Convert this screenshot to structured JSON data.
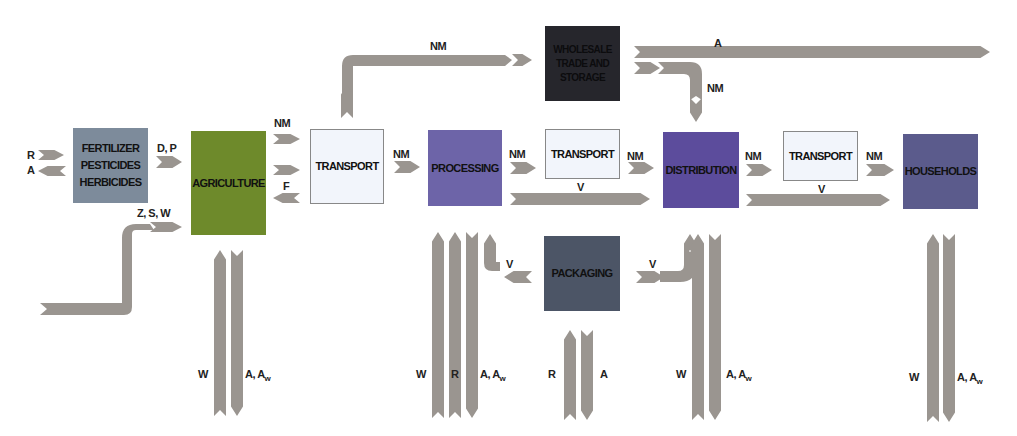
{
  "diagram": {
    "nodes": {
      "fertilizer": {
        "label": "FERTILIZER\nPESTICIDES\nHERBICIDES",
        "color": "#7d8b9b"
      },
      "agriculture": {
        "label": "AGRICULTURE",
        "color": "#6e8a2b"
      },
      "transport1": {
        "label": "TRANSPORT",
        "color": "#f2f5fb"
      },
      "processing": {
        "label": "PROCESSING",
        "color": "#6d64a8"
      },
      "transport2": {
        "label": "TRANSPORT",
        "color": "#f2f5fb"
      },
      "wholesale": {
        "label": "WHOLESALE\nTRADE AND\nSTORAGE",
        "color": "#26262c"
      },
      "distribution": {
        "label": "DISTRIBUTION",
        "color": "#5c4c9c"
      },
      "transport3": {
        "label": "TRANSPORT",
        "color": "#f2f5fb"
      },
      "households": {
        "label": "HOUSEHOLDS",
        "color": "#5b5b8c"
      },
      "packaging": {
        "label": "PACKAGING",
        "color": "#4c5566"
      }
    },
    "flow_labels": {
      "r_in_fert": "R",
      "a_out_fert": "A",
      "dp": "D, P",
      "zsw": "Z, S, W",
      "nm_ag_tr": "NM",
      "f_ag": "F",
      "nm_top": "NM",
      "nm_tr_proc": "NM",
      "nm_proc_tr": "NM",
      "v_proc": "V",
      "nm_tr_dist": "NM",
      "a_top": "A",
      "nm_wh_dist": "NM",
      "nm_dist_tr": "NM",
      "v_dist": "V",
      "nm_tr_house": "NM",
      "v_pack_left": "V",
      "v_pack_right": "V",
      "w_ag": "W",
      "a_ag": "A, A",
      "w_proc": "W",
      "r_proc": "R",
      "a_proc": "A, A",
      "r_pack": "R",
      "a_pack": "A",
      "w_dist": "W",
      "a_dist": "A, A",
      "w_house": "W",
      "a_house": "A, A"
    },
    "subscript": "w",
    "arrow_color": "#9a9590"
  }
}
